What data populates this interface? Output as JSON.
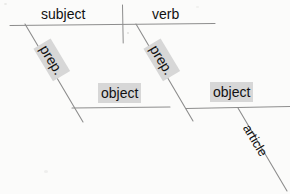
{
  "diagram": {
    "type": "sentence-diagram",
    "background_color": "#fbfbfa",
    "line_color": "#8a8a8a",
    "text_color": "#111111",
    "highlight_color": "#d7d7d7",
    "labels": {
      "subject": "subject",
      "verb": "verb",
      "prep_left": "prep.",
      "prep_right": "prep.",
      "object_left": "object",
      "object_right": "object",
      "article": "article"
    },
    "lines": {
      "baseline": {
        "x1": 10,
        "y1": 25,
        "x2": 215,
        "y2": 23
      },
      "divider": {
        "x1": 122,
        "y1": 5,
        "x2": 123,
        "y2": 43
      },
      "prep_slant_left": {
        "x1": 25,
        "y1": 24,
        "x2": 83,
        "y2": 122
      },
      "prep_slant_right": {
        "x1": 136,
        "y1": 24,
        "x2": 193,
        "y2": 121
      },
      "object_baseline_left": {
        "x1": 72,
        "y1": 108,
        "x2": 170,
        "y2": 107
      },
      "object_baseline_right": {
        "x1": 185,
        "y1": 108,
        "x2": 290,
        "y2": 106
      },
      "article_slant": {
        "x1": 238,
        "y1": 108,
        "x2": 286,
        "y2": 190
      }
    }
  }
}
